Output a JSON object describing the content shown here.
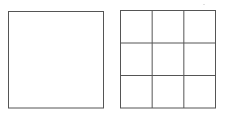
{
  "diagram": {
    "figures": [
      {
        "name": "plain-square",
        "rows": 1,
        "cols": 1
      },
      {
        "name": "grid-square",
        "rows": 3,
        "cols": 3
      }
    ],
    "stroke_color": "#555555",
    "background_color": "#ffffff"
  }
}
